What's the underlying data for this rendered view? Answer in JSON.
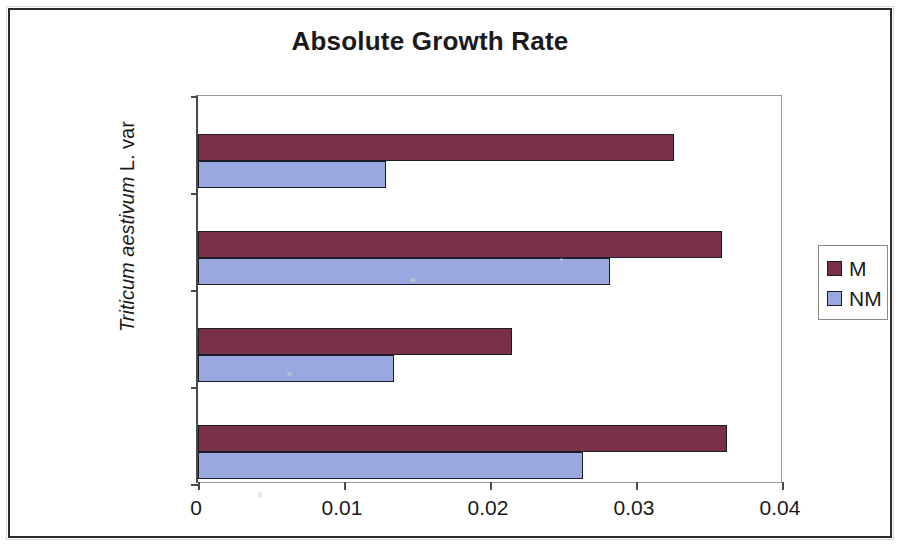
{
  "chart_data": {
    "type": "bar",
    "orientation": "horizontal",
    "title": "Absolute Growth Rate",
    "xlabel": "",
    "ylabel": "Triticum aestivum L. var",
    "ylabel_italic_part": "Triticum aestivum",
    "ylabel_roman_part": " L. var",
    "categories": [
      "DWR 162",
      "DWR 195",
      "DWR 225",
      "NI5439"
    ],
    "series": [
      {
        "name": "M",
        "color": "#7b3049",
        "values": [
          0.0362,
          0.0215,
          0.0359,
          0.0326
        ]
      },
      {
        "name": "NM",
        "color": "#9aa8e0",
        "values": [
          0.0264,
          0.0134,
          0.0282,
          0.0129
        ]
      }
    ],
    "xticks": [
      "0",
      "0.01",
      "0.02",
      "0.03",
      "0.04"
    ],
    "xtick_values": [
      0,
      0.01,
      0.02,
      0.03,
      0.04
    ],
    "xlim": [
      0,
      0.04
    ],
    "grid": false,
    "legend_position": "right"
  },
  "legend": {
    "items": [
      {
        "label": "M",
        "color": "#7b3049"
      },
      {
        "label": "NM",
        "color": "#9aa8e0"
      }
    ]
  }
}
